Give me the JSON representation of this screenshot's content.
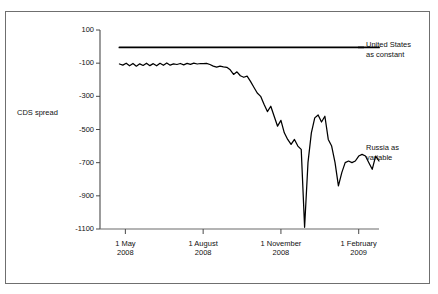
{
  "chart_data": {
    "type": "line",
    "title": "",
    "subtitle": "",
    "xlabel": "",
    "ylabel": "CDS spread",
    "ylim": [
      -1100,
      100
    ],
    "xlim": [
      0,
      330
    ],
    "grid": false,
    "legend_position": "right-inline",
    "yticks": [
      100,
      -100,
      -300,
      -500,
      -700,
      -900,
      -1100
    ],
    "ytick_labels": [
      "100",
      "-100",
      "-300",
      "-500",
      "-700",
      "-900",
      "-1100"
    ],
    "xticks": [
      30,
      122,
      214,
      306
    ],
    "xtick_labels": [
      {
        "line1": "1 May",
        "line2": "2008"
      },
      {
        "line1": "1 August",
        "line2": "2008"
      },
      {
        "line1": "1 November",
        "line2": "2008"
      },
      {
        "line1": "1 February",
        "line2": "2009"
      }
    ],
    "series": [
      {
        "name": "United States as constant",
        "label_line1": "United States",
        "label_line2": "as constant",
        "color": "#000000",
        "x": [
          23,
          30,
          50,
          70,
          90,
          110,
          122,
          140,
          160,
          180,
          200,
          214,
          230,
          250,
          270,
          290,
          306,
          320,
          330
        ],
        "values": [
          -5,
          -5,
          -5,
          -5,
          -5,
          -5,
          -5,
          -5,
          -5,
          -5,
          -5,
          -5,
          -5,
          -5,
          -5,
          -5,
          -5,
          -5,
          -5
        ]
      },
      {
        "name": "Russia as variable",
        "label_line1": "Russia as",
        "label_line2": "variable",
        "color": "#000000",
        "x": [
          23,
          27,
          31,
          35,
          39,
          43,
          47,
          51,
          55,
          59,
          63,
          67,
          71,
          75,
          79,
          83,
          87,
          91,
          95,
          99,
          103,
          107,
          111,
          115,
          119,
          122,
          126,
          130,
          134,
          138,
          142,
          146,
          150,
          154,
          158,
          162,
          166,
          170,
          174,
          178,
          182,
          186,
          190,
          194,
          198,
          202,
          206,
          210,
          214,
          218,
          222,
          226,
          230,
          234,
          238,
          242,
          246,
          250,
          254,
          258,
          262,
          266,
          270,
          274,
          278,
          282,
          286,
          290,
          294,
          298,
          302,
          306,
          310,
          314,
          318,
          322,
          326,
          330
        ],
        "values": [
          -105,
          -112,
          -100,
          -116,
          -102,
          -118,
          -104,
          -114,
          -100,
          -115,
          -103,
          -116,
          -101,
          -113,
          -99,
          -112,
          -104,
          -108,
          -102,
          -110,
          -101,
          -107,
          -100,
          -105,
          -102,
          -103,
          -101,
          -108,
          -118,
          -124,
          -118,
          -122,
          -125,
          -140,
          -168,
          -152,
          -176,
          -185,
          -178,
          -210,
          -245,
          -280,
          -300,
          -348,
          -392,
          -360,
          -420,
          -480,
          -445,
          -520,
          -560,
          -590,
          -560,
          -600,
          -620,
          -1090,
          -700,
          -520,
          -430,
          -412,
          -455,
          -420,
          -560,
          -600,
          -700,
          -840,
          -760,
          -700,
          -690,
          -700,
          -690,
          -660,
          -650,
          -660,
          -700,
          -740,
          -660,
          -690
        ]
      }
    ],
    "annotations": []
  }
}
